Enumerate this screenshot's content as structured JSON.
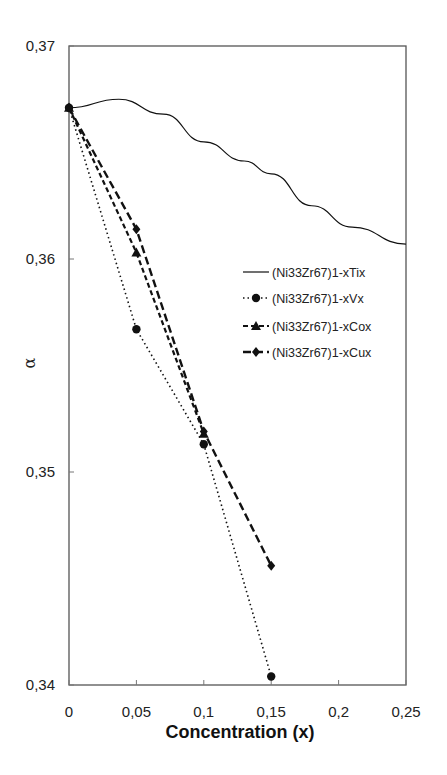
{
  "chart_data": {
    "type": "line",
    "title": "",
    "xlabel": "Concentration (x)",
    "ylabel": "α",
    "xlim": [
      0,
      0.25
    ],
    "ylim": [
      0.34,
      0.37
    ],
    "x_ticks": [
      "0",
      "0,05",
      "0,1",
      "0,15",
      "0,2",
      "0,25"
    ],
    "y_ticks": [
      "0,34",
      "0,35",
      "0,36",
      "0,37"
    ],
    "grid": false,
    "legend_position": "center-right inside plot",
    "series": [
      {
        "name": "(Ni33Zr67)1-xTix",
        "style": "solid",
        "marker": "none",
        "x": [
          0,
          0.037,
          0.07,
          0.1,
          0.13,
          0.15,
          0.18,
          0.21,
          0.25
        ],
        "values": [
          0.3671,
          0.3675,
          0.3668,
          0.3655,
          0.3646,
          0.364,
          0.3625,
          0.3615,
          0.3607
        ]
      },
      {
        "name": "(Ni33Zr67)1-xVx",
        "style": "dotted",
        "marker": "circle",
        "x": [
          0,
          0.05,
          0.1,
          0.15
        ],
        "values": [
          0.3671,
          0.3567,
          0.3513,
          0.3404
        ]
      },
      {
        "name": "(Ni33Zr67)1-xCox",
        "style": "dashed",
        "marker": "triangle",
        "x": [
          0,
          0.05,
          0.1
        ],
        "values": [
          0.3671,
          0.3603,
          0.3518
        ]
      },
      {
        "name": "(Ni33Zr67)1-xCux",
        "style": "long-dashed",
        "marker": "diamond",
        "x": [
          0,
          0.05,
          0.1,
          0.15
        ],
        "values": [
          0.3671,
          0.3614,
          0.3519,
          0.3456
        ]
      }
    ]
  }
}
